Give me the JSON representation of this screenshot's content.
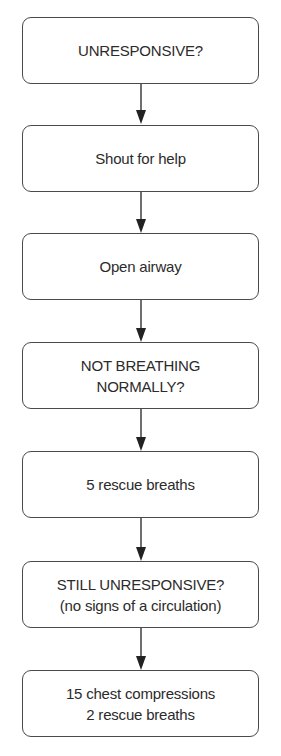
{
  "flowchart": {
    "nodes": [
      {
        "id": "n1",
        "lines": [
          "UNRESPONSIVE?"
        ]
      },
      {
        "id": "n2",
        "lines": [
          "Shout for help"
        ]
      },
      {
        "id": "n3",
        "lines": [
          "Open airway"
        ]
      },
      {
        "id": "n4",
        "lines": [
          "NOT BREATHING",
          "NORMALLY?"
        ]
      },
      {
        "id": "n5",
        "lines": [
          "5 rescue breaths"
        ]
      },
      {
        "id": "n6",
        "lines": [
          "STILL UNRESPONSIVE?",
          "(no signs of a circulation)"
        ]
      },
      {
        "id": "n7",
        "lines": [
          "15 chest compressions",
          "2 rescue breaths"
        ]
      }
    ],
    "edges": [
      {
        "from": "n1",
        "to": "n2"
      },
      {
        "from": "n2",
        "to": "n3"
      },
      {
        "from": "n3",
        "to": "n4"
      },
      {
        "from": "n4",
        "to": "n5"
      },
      {
        "from": "n5",
        "to": "n6"
      },
      {
        "from": "n6",
        "to": "n7"
      }
    ],
    "colors": {
      "stroke": "#4a4a4a",
      "text": "#2b2b2b",
      "background": "#ffffff"
    }
  }
}
